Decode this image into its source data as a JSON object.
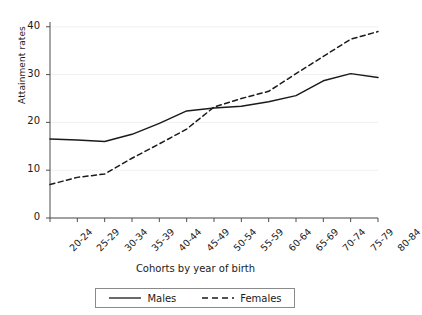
{
  "chart_data": {
    "type": "line",
    "title": "",
    "xlabel": "Cohorts by year of birth",
    "ylabel": "Attainment rates",
    "categories": [
      "20-24",
      "25-29",
      "30-34",
      "35-39",
      "40-44",
      "45-49",
      "50-54",
      "55-59",
      "60-64",
      "65-69",
      "70-74",
      "75-79",
      "80-84"
    ],
    "yticks": [
      0,
      10,
      20,
      30,
      40
    ],
    "ylim": [
      0,
      41
    ],
    "grid": true,
    "legend_position": "bottom",
    "series": [
      {
        "name": "Males",
        "style": "solid",
        "color": "#1a1a1a",
        "values": [
          16.5,
          16.3,
          16.0,
          17.5,
          19.8,
          22.4,
          23.0,
          23.4,
          24.3,
          25.6,
          28.7,
          30.2,
          29.4
        ]
      },
      {
        "name": "Females",
        "style": "dashed",
        "color": "#1a1a1a",
        "values": [
          7.0,
          8.5,
          9.2,
          12.5,
          15.5,
          18.6,
          23.2,
          25.0,
          26.5,
          30.2,
          33.8,
          37.4,
          39.0
        ]
      }
    ]
  },
  "axis": {
    "y_label": "Attainment rates",
    "x_label": "Cohorts by year of birth",
    "y_tick_labels": [
      "0",
      "10",
      "20",
      "30",
      "40"
    ],
    "x_tick_labels": [
      "20-24",
      "25-29",
      "30-34",
      "35-39",
      "40-44",
      "45-49",
      "50-54",
      "55-59",
      "60-64",
      "65-69",
      "70-74",
      "75-79",
      "80-84"
    ]
  },
  "legend": {
    "items": [
      {
        "label": "Males",
        "style": "solid"
      },
      {
        "label": "Females",
        "style": "dashed"
      }
    ]
  },
  "colors": {
    "line": "#1a1a1a",
    "axis": "#4d4d4d",
    "grid": "#f0f0f0",
    "background": "#ffffff",
    "legend_border": "#8a8a8a"
  }
}
